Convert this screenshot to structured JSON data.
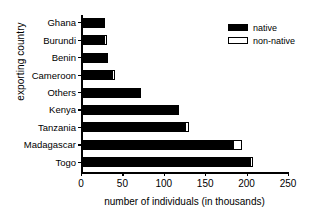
{
  "chart_data": {
    "type": "bar",
    "orientation": "horizontal",
    "stacked": true,
    "title": "",
    "xlabel": "number of individuals (in thousands)",
    "ylabel": "exporting country",
    "categories": [
      "Ghana",
      "Burundi",
      "Benin",
      "Cameroon",
      "Others",
      "Kenya",
      "Tanzania",
      "Madagascar",
      "Togo"
    ],
    "series": [
      {
        "name": "native",
        "color": "#000000",
        "values": [
          28,
          26,
          31,
          36,
          71,
          117,
          124,
          182,
          203
        ]
      },
      {
        "name": "non-native",
        "color": "#ffffff",
        "values": [
          0,
          4,
          0,
          4,
          0,
          0,
          5,
          11,
          3
        ]
      }
    ],
    "totals": [
      28,
      30,
      31,
      40,
      71,
      117,
      129,
      193,
      206
    ],
    "xlim": [
      0,
      250
    ],
    "xticks": [
      0,
      50,
      100,
      150,
      200,
      250
    ],
    "xticklabels": [
      "0",
      "50",
      "100",
      "150",
      "200",
      "250"
    ],
    "grid": false,
    "legend": {
      "position": "top-right",
      "entries": [
        {
          "label": "native",
          "swatch": "filled-black-rect"
        },
        {
          "label": "non-native",
          "swatch": "outlined-white-rect"
        }
      ]
    }
  }
}
